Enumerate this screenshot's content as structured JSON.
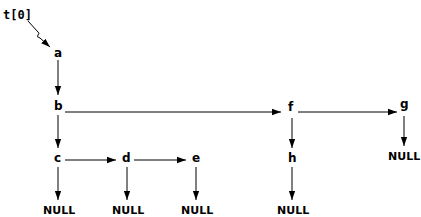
{
  "pointer": {
    "label": "t[0]",
    "target": "a"
  },
  "nodes": {
    "a": {
      "label": "a"
    },
    "b": {
      "label": "b"
    },
    "c": {
      "label": "c"
    },
    "d": {
      "label": "d"
    },
    "e": {
      "label": "e"
    },
    "f": {
      "label": "f"
    },
    "g": {
      "label": "g"
    },
    "h": {
      "label": "h"
    }
  },
  "null_label": "NULL",
  "nulls": {
    "c": "NULL",
    "d": "NULL",
    "e": "NULL",
    "h": "NULL",
    "g": "NULL"
  },
  "edges": [
    {
      "from": "t[0]",
      "to": "a",
      "type": "pointer"
    },
    {
      "from": "a",
      "to": "b",
      "type": "child"
    },
    {
      "from": "b",
      "to": "c",
      "type": "child"
    },
    {
      "from": "b",
      "to": "f",
      "type": "sibling"
    },
    {
      "from": "f",
      "to": "g",
      "type": "sibling"
    },
    {
      "from": "c",
      "to": "d",
      "type": "sibling"
    },
    {
      "from": "d",
      "to": "e",
      "type": "sibling"
    },
    {
      "from": "f",
      "to": "h",
      "type": "child"
    },
    {
      "from": "c",
      "to": "NULL",
      "type": "child"
    },
    {
      "from": "d",
      "to": "NULL",
      "type": "child"
    },
    {
      "from": "e",
      "to": "NULL",
      "type": "child"
    },
    {
      "from": "h",
      "to": "NULL",
      "type": "child"
    },
    {
      "from": "g",
      "to": "NULL",
      "type": "child"
    }
  ]
}
